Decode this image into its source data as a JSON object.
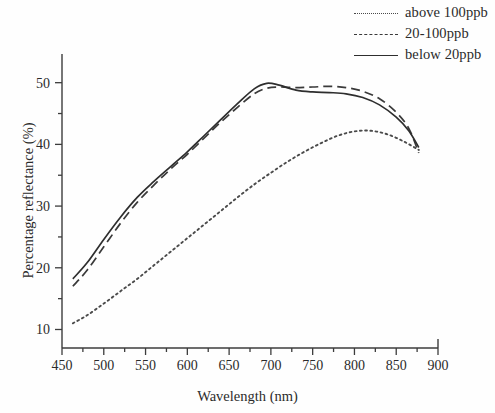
{
  "chart_data": {
    "type": "line",
    "title": "",
    "xlabel": "Wavelength (nm)",
    "ylabel": "Percentage reflectance (%)",
    "xlim": [
      450,
      900
    ],
    "ylim": [
      7,
      54
    ],
    "xticks": [
      450,
      500,
      550,
      600,
      650,
      700,
      750,
      800,
      850,
      900
    ],
    "yticks": [
      10,
      20,
      30,
      40,
      50
    ],
    "x_minor_step": 25,
    "y_minor_step": 5,
    "grid": false,
    "legend_position": "top-right",
    "axis_style": "left-and-bottom-spines",
    "series": [
      {
        "name": "above 100ppb",
        "style": "dotted",
        "color": "#4a4a4a",
        "x": [
          463,
          480,
          500,
          520,
          540,
          560,
          580,
          600,
          620,
          640,
          660,
          680,
          700,
          720,
          740,
          760,
          780,
          800,
          820,
          840,
          860,
          877
        ],
        "y": [
          11.0,
          12.3,
          14.2,
          16.2,
          18.2,
          20.4,
          22.6,
          24.8,
          27.0,
          29.2,
          31.4,
          33.5,
          35.4,
          37.2,
          38.8,
          40.2,
          41.4,
          42.1,
          42.2,
          41.6,
          40.4,
          39.1
        ]
      },
      {
        "name": "20-100ppb",
        "style": "dashed",
        "color": "#3a3a3a",
        "x": [
          463,
          480,
          500,
          520,
          540,
          560,
          580,
          600,
          620,
          640,
          660,
          680,
          695,
          710,
          730,
          750,
          770,
          790,
          810,
          830,
          850,
          865,
          877
        ],
        "y": [
          17.0,
          19.6,
          23.4,
          27.2,
          30.6,
          33.4,
          36.0,
          38.4,
          41.0,
          43.6,
          46.0,
          48.2,
          49.1,
          49.3,
          49.2,
          49.3,
          49.4,
          49.2,
          48.6,
          47.4,
          45.2,
          42.6,
          38.6
        ]
      },
      {
        "name": "below 20ppb",
        "style": "solid",
        "color": "#2e2e2e",
        "x": [
          463,
          480,
          500,
          520,
          540,
          560,
          580,
          600,
          620,
          640,
          660,
          680,
          695,
          710,
          730,
          750,
          770,
          790,
          810,
          830,
          850,
          865,
          877
        ],
        "y": [
          18.2,
          20.8,
          24.6,
          28.2,
          31.4,
          34.0,
          36.4,
          38.8,
          41.4,
          44.0,
          46.6,
          49.0,
          49.9,
          49.6,
          48.8,
          48.5,
          48.4,
          48.2,
          47.6,
          46.4,
          44.4,
          42.2,
          39.5
        ]
      }
    ]
  },
  "legend": {
    "items": [
      {
        "label": "above 100ppb",
        "style": "dotted"
      },
      {
        "label": "20-100ppb",
        "style": "dashed"
      },
      {
        "label": "below 20ppb",
        "style": "solid"
      }
    ]
  },
  "axes": {
    "x_title": "Wavelength (nm)",
    "y_title": "Percentage reflectance (%)"
  }
}
